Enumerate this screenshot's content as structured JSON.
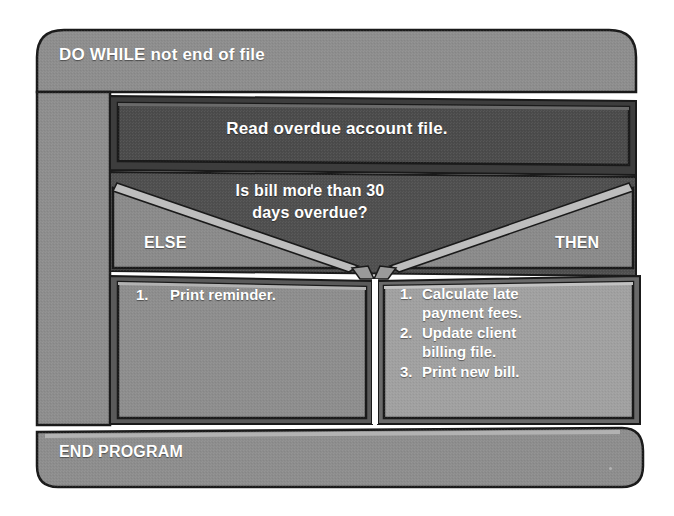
{
  "diagram": {
    "type": "nassi-shneiderman-structure-chart",
    "colors": {
      "page_background": "#ffffff",
      "outer_block": "#8d8d8d",
      "process_block_dark": "#4b4b4b",
      "condition_block": "#5a5a5a",
      "branch_block_left": "#898989",
      "branch_block_right": "#a0a0a0",
      "condition_wing": "#8a8a8a",
      "highlight_edge": "#b9b9b9",
      "outline": "#1a1a1a",
      "text": "#ffffff"
    },
    "loop": {
      "keyword": "DO WHILE",
      "condition": "not end of file",
      "header_label": "DO WHILE not end of file"
    },
    "process": {
      "label": "Read overdue account file."
    },
    "decision": {
      "question_line_1": "Is bill more than 30",
      "question_line_2": "days overdue?",
      "question_full": "Is bill more than 30 days overdue?",
      "else_label": "ELSE",
      "then_label": "THEN"
    },
    "else_branch": {
      "steps": [
        {
          "number": "1.",
          "text": "Print reminder."
        }
      ]
    },
    "then_branch": {
      "steps": [
        {
          "number": "1.",
          "text": "Calculate late\npayment fees."
        },
        {
          "number": "2.",
          "text": "Update client\nbilling file."
        },
        {
          "number": "3.",
          "text": "Print new bill."
        }
      ]
    },
    "footer": {
      "label": "END PROGRAM"
    }
  }
}
